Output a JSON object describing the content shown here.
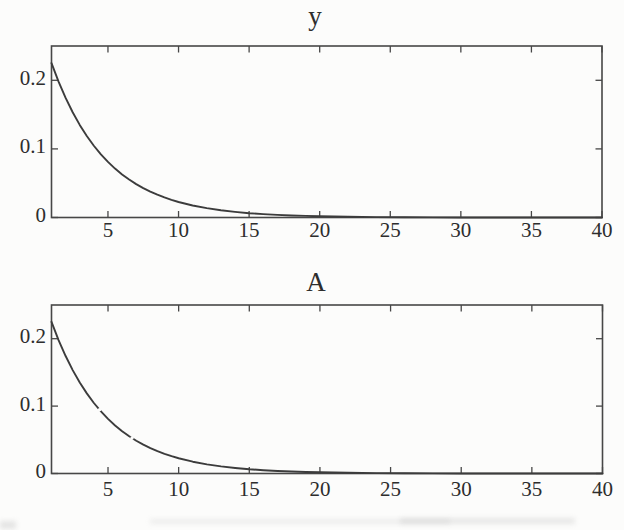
{
  "figure": {
    "background": "#fcfcfb",
    "frame_color": "#474747",
    "curve_color": "#3c3c3c",
    "label_color": "#2d2d2d",
    "scan_artifact_color": "#b9b9b9"
  },
  "chart_data": [
    {
      "type": "line",
      "title": "y",
      "xlim": [
        1,
        40
      ],
      "ylim": [
        0,
        0.25
      ],
      "xticks": [
        5,
        10,
        15,
        20,
        25,
        30,
        35,
        40
      ],
      "xtick_labels": [
        "5",
        "10",
        "15",
        "20",
        "25",
        "30",
        "35",
        "40"
      ],
      "yticks": [
        0,
        0.1,
        0.2
      ],
      "ytick_labels": [
        "0",
        "0.1",
        "0.2"
      ],
      "grid": false,
      "legend": null,
      "line_style": "solid",
      "x": [
        1,
        1.5,
        2,
        2.5,
        3,
        3.5,
        4,
        4.5,
        5,
        5.5,
        6,
        6.5,
        7,
        7.5,
        8,
        8.5,
        9,
        9.5,
        10,
        11,
        12,
        13,
        14,
        15,
        16,
        17,
        18,
        19,
        20,
        22,
        24,
        26,
        28,
        30,
        32,
        34,
        36,
        38,
        40
      ],
      "y": [
        0.225,
        0.198,
        0.1743,
        0.1534,
        0.135,
        0.1189,
        0.1046,
        0.0921,
        0.081,
        0.0713,
        0.0628,
        0.0553,
        0.0486,
        0.0428,
        0.0377,
        0.0332,
        0.0292,
        0.0257,
        0.0226,
        0.0175,
        0.0136,
        0.0105,
        0.0082,
        0.0063,
        0.0049,
        0.0038,
        0.003,
        0.0023,
        0.0018,
        0.0011,
        0.0006,
        0.0004,
        0.0002,
        0.0001,
        0.0001,
        0,
        0,
        0,
        0
      ]
    },
    {
      "type": "line",
      "title": "A",
      "xlim": [
        1,
        40
      ],
      "ylim": [
        0,
        0.25
      ],
      "xticks": [
        5,
        10,
        15,
        20,
        25,
        30,
        35,
        40
      ],
      "xtick_labels": [
        "5",
        "10",
        "15",
        "20",
        "25",
        "30",
        "35",
        "40"
      ],
      "yticks": [
        0,
        0.1,
        0.2
      ],
      "ytick_labels": [
        "0",
        "0.1",
        "0.2"
      ],
      "grid": false,
      "legend": null,
      "line_style": "solid-with-breaks",
      "gaps_at_x": [
        4.4,
        6.7
      ],
      "x": [
        1,
        1.5,
        2,
        2.5,
        3,
        3.5,
        4,
        4.5,
        5,
        5.5,
        6,
        6.5,
        7,
        7.5,
        8,
        8.5,
        9,
        9.5,
        10,
        11,
        12,
        13,
        14,
        15,
        16,
        17,
        18,
        19,
        20,
        22,
        24,
        26,
        28,
        30,
        32,
        34,
        36,
        38,
        40
      ],
      "y": [
        0.225,
        0.198,
        0.1743,
        0.1534,
        0.135,
        0.1189,
        0.1046,
        0.0921,
        0.081,
        0.0713,
        0.0628,
        0.0553,
        0.0486,
        0.0428,
        0.0377,
        0.0332,
        0.0292,
        0.0257,
        0.0226,
        0.0175,
        0.0136,
        0.0105,
        0.0082,
        0.0063,
        0.0049,
        0.0038,
        0.003,
        0.0023,
        0.0018,
        0.0011,
        0.0006,
        0.0004,
        0.0002,
        0.0001,
        0.0001,
        0,
        0,
        0,
        0
      ]
    }
  ]
}
